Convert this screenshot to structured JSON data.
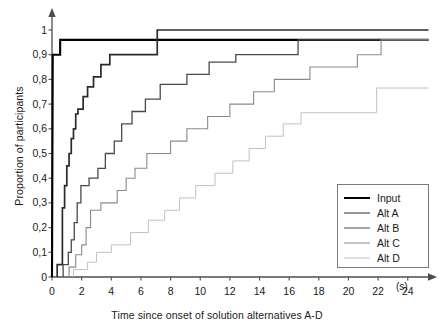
{
  "chart_data": {
    "type": "line",
    "subtype": "step-cumulative",
    "title": "",
    "xlabel": "Time since onset of solution alternatives A-D",
    "ylabel": "Proportion of participants",
    "xunit": "(s)",
    "xlim": [
      0,
      25.5
    ],
    "ylim": [
      0,
      1.05
    ],
    "grid": false,
    "legend_position": "inside-bottom-right",
    "xticks": [
      0,
      2,
      4,
      6,
      8,
      10,
      12,
      14,
      16,
      18,
      20,
      22,
      24
    ],
    "xticklabels": [
      "0",
      "2",
      "4",
      "6",
      "8",
      "10",
      "12",
      "14",
      "16",
      "18",
      "20",
      "22",
      "24"
    ],
    "yticks": [
      0,
      0.1,
      0.2,
      0.3,
      0.4,
      0.5,
      0.6,
      0.7,
      0.8,
      0.9,
      1
    ],
    "yticklabels": [
      "0",
      "0,1",
      "0,2",
      "0,3",
      "0,4",
      "0,5",
      "0,6",
      "0,7",
      "0,8",
      "0,9",
      "1"
    ],
    "series": [
      {
        "name": "Input",
        "color": "#000000",
        "width": 2.1,
        "points": [
          [
            0.0,
            0.0
          ],
          [
            0.05,
            0.9
          ],
          [
            0.55,
            0.9
          ],
          [
            0.55,
            0.96
          ],
          [
            25.4,
            0.96
          ]
        ]
      },
      {
        "name": "Alt A",
        "color": "#2b2b2b",
        "width": 1.7,
        "points": [
          [
            0.35,
            0.0
          ],
          [
            0.35,
            0.05
          ],
          [
            0.7,
            0.05
          ],
          [
            0.7,
            0.28
          ],
          [
            0.85,
            0.28
          ],
          [
            0.85,
            0.37
          ],
          [
            1.0,
            0.37
          ],
          [
            1.0,
            0.45
          ],
          [
            1.15,
            0.45
          ],
          [
            1.15,
            0.5
          ],
          [
            1.3,
            0.5
          ],
          [
            1.3,
            0.56
          ],
          [
            1.45,
            0.56
          ],
          [
            1.45,
            0.6
          ],
          [
            1.6,
            0.6
          ],
          [
            1.6,
            0.66
          ],
          [
            1.75,
            0.66
          ],
          [
            1.75,
            0.68
          ],
          [
            2.1,
            0.68
          ],
          [
            2.1,
            0.73
          ],
          [
            2.4,
            0.73
          ],
          [
            2.4,
            0.77
          ],
          [
            2.8,
            0.77
          ],
          [
            2.8,
            0.81
          ],
          [
            3.3,
            0.81
          ],
          [
            3.3,
            0.86
          ],
          [
            3.9,
            0.86
          ],
          [
            3.9,
            0.9
          ],
          [
            7.1,
            0.9
          ],
          [
            7.1,
            1.0
          ],
          [
            25.4,
            1.0
          ]
        ]
      },
      {
        "name": "Alt B",
        "color": "#4a4a4a",
        "width": 1.3,
        "points": [
          [
            0.75,
            0.0
          ],
          [
            0.75,
            0.05
          ],
          [
            1.1,
            0.05
          ],
          [
            1.1,
            0.1
          ],
          [
            1.3,
            0.1
          ],
          [
            1.3,
            0.15
          ],
          [
            1.5,
            0.15
          ],
          [
            1.5,
            0.22
          ],
          [
            1.7,
            0.22
          ],
          [
            1.7,
            0.3
          ],
          [
            1.95,
            0.3
          ],
          [
            1.95,
            0.37
          ],
          [
            2.5,
            0.37
          ],
          [
            2.5,
            0.4
          ],
          [
            3.1,
            0.4
          ],
          [
            3.1,
            0.44
          ],
          [
            3.6,
            0.44
          ],
          [
            3.6,
            0.5
          ],
          [
            4.2,
            0.5
          ],
          [
            4.2,
            0.55
          ],
          [
            4.7,
            0.55
          ],
          [
            4.7,
            0.62
          ],
          [
            5.4,
            0.62
          ],
          [
            5.4,
            0.67
          ],
          [
            6.3,
            0.67
          ],
          [
            6.3,
            0.72
          ],
          [
            7.3,
            0.72
          ],
          [
            7.3,
            0.78
          ],
          [
            9.1,
            0.78
          ],
          [
            9.1,
            0.82
          ],
          [
            10.6,
            0.82
          ],
          [
            10.6,
            0.87
          ],
          [
            12.4,
            0.87
          ],
          [
            12.4,
            0.9
          ],
          [
            16.6,
            0.9
          ],
          [
            16.6,
            0.96
          ],
          [
            25.4,
            0.96
          ]
        ]
      },
      {
        "name": "Alt C",
        "color": "#8a8a8a",
        "width": 1.1,
        "points": [
          [
            1.15,
            0.0
          ],
          [
            1.15,
            0.04
          ],
          [
            1.6,
            0.04
          ],
          [
            1.6,
            0.09
          ],
          [
            2.0,
            0.09
          ],
          [
            2.0,
            0.13
          ],
          [
            2.3,
            0.13
          ],
          [
            2.3,
            0.2
          ],
          [
            2.6,
            0.2
          ],
          [
            2.6,
            0.27
          ],
          [
            3.3,
            0.27
          ],
          [
            3.3,
            0.3
          ],
          [
            4.4,
            0.3
          ],
          [
            4.4,
            0.35
          ],
          [
            5.0,
            0.35
          ],
          [
            5.0,
            0.4
          ],
          [
            5.6,
            0.4
          ],
          [
            5.6,
            0.44
          ],
          [
            6.4,
            0.44
          ],
          [
            6.4,
            0.5
          ],
          [
            8.0,
            0.5
          ],
          [
            8.0,
            0.55
          ],
          [
            9.1,
            0.55
          ],
          [
            9.1,
            0.6
          ],
          [
            10.5,
            0.6
          ],
          [
            10.5,
            0.65
          ],
          [
            12.0,
            0.65
          ],
          [
            12.0,
            0.7
          ],
          [
            13.6,
            0.7
          ],
          [
            13.6,
            0.75
          ],
          [
            15.0,
            0.75
          ],
          [
            15.0,
            0.8
          ],
          [
            17.4,
            0.8
          ],
          [
            17.4,
            0.85
          ],
          [
            20.6,
            0.85
          ],
          [
            20.6,
            0.9
          ],
          [
            22.2,
            0.9
          ],
          [
            22.2,
            0.96
          ],
          [
            25.4,
            0.96
          ]
        ]
      },
      {
        "name": "Alt D",
        "color": "#c2c2c2",
        "width": 1.0,
        "points": [
          [
            1.45,
            0.0
          ],
          [
            1.45,
            0.03
          ],
          [
            2.4,
            0.03
          ],
          [
            2.4,
            0.06
          ],
          [
            3.0,
            0.06
          ],
          [
            3.0,
            0.1
          ],
          [
            4.0,
            0.1
          ],
          [
            4.0,
            0.13
          ],
          [
            5.3,
            0.13
          ],
          [
            5.3,
            0.18
          ],
          [
            6.5,
            0.18
          ],
          [
            6.5,
            0.23
          ],
          [
            7.6,
            0.23
          ],
          [
            7.6,
            0.27
          ],
          [
            8.6,
            0.27
          ],
          [
            8.6,
            0.32
          ],
          [
            9.7,
            0.32
          ],
          [
            9.7,
            0.37
          ],
          [
            11.0,
            0.37
          ],
          [
            11.0,
            0.42
          ],
          [
            12.2,
            0.42
          ],
          [
            12.2,
            0.47
          ],
          [
            13.3,
            0.47
          ],
          [
            13.3,
            0.52
          ],
          [
            14.4,
            0.52
          ],
          [
            14.4,
            0.57
          ],
          [
            15.6,
            0.57
          ],
          [
            15.6,
            0.62
          ],
          [
            16.8,
            0.62
          ],
          [
            16.8,
            0.665
          ],
          [
            21.9,
            0.665
          ],
          [
            21.9,
            0.765
          ],
          [
            25.4,
            0.765
          ]
        ]
      }
    ]
  },
  "legend": {
    "items": [
      {
        "label": "Input"
      },
      {
        "label": "Alt A"
      },
      {
        "label": "Alt B"
      },
      {
        "label": "Alt C"
      },
      {
        "label": "Alt D"
      }
    ]
  },
  "axes": {
    "y_title": "Proportion of participants",
    "x_title": "Time since onset of solution alternatives A-D",
    "x_unit": "(s)"
  }
}
